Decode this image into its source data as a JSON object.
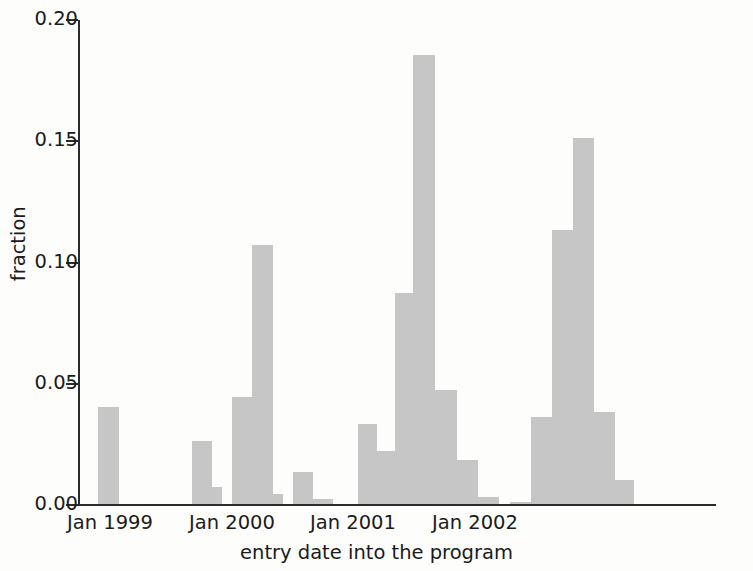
{
  "chart_data": {
    "type": "bar",
    "title": "",
    "subtitle": "",
    "xlabel": "entry date into the program",
    "ylabel": "fraction",
    "ylim": [
      0.0,
      0.2
    ],
    "y_ticks": [
      0.0,
      0.05,
      0.1,
      0.15,
      0.2
    ],
    "y_tick_labels": [
      "0.00",
      "0.05",
      "0.10",
      "0.15",
      "0.20"
    ],
    "x_tick_labels": [
      "Jan 1999",
      "Jan 2000",
      "Jan 2001",
      "Jan 2002"
    ],
    "x_tick_months": [
      "1999-01",
      "2000-01",
      "2001-01",
      "2002-01"
    ],
    "grid": false,
    "legend": null,
    "bar_color": "#c6c6c6",
    "axis_color": "#2b2b2b",
    "note": "histogram of entry dates, bin width approx 1-2 months",
    "categories": [
      "1999-01",
      "1999-09",
      "1999-11",
      "1999-12",
      "2000-01",
      "2000-03",
      "2000-06",
      "2000-08",
      "2000-12",
      "2001-02",
      "2001-03",
      "2001-04",
      "2001-05",
      "2001-06",
      "2001-08",
      "2001-11",
      "2001-12",
      "2002-01",
      "2002-02",
      "2002-03",
      "2002-05"
    ],
    "values": [
      0.04,
      0.026,
      0.007,
      0.044,
      0.107,
      0.004,
      0.013,
      0.002,
      0.033,
      0.022,
      0.087,
      0.185,
      0.047,
      0.018,
      0.003,
      0.001,
      0.036,
      0.113,
      0.151,
      0.038,
      0.01
    ],
    "bars_px": [
      {
        "x": 98,
        "w": 21,
        "v": 0.04
      },
      {
        "x": 192,
        "w": 20,
        "v": 0.026
      },
      {
        "x": 212,
        "w": 10,
        "v": 0.007
      },
      {
        "x": 232,
        "w": 20,
        "v": 0.044
      },
      {
        "x": 252,
        "w": 21,
        "v": 0.107
      },
      {
        "x": 273,
        "w": 10,
        "v": 0.004
      },
      {
        "x": 293,
        "w": 20,
        "v": 0.013
      },
      {
        "x": 313,
        "w": 20,
        "v": 0.002
      },
      {
        "x": 358,
        "w": 19,
        "v": 0.033
      },
      {
        "x": 377,
        "w": 18,
        "v": 0.022
      },
      {
        "x": 395,
        "w": 18,
        "v": 0.087
      },
      {
        "x": 413,
        "w": 22,
        "v": 0.185
      },
      {
        "x": 435,
        "w": 22,
        "v": 0.047
      },
      {
        "x": 457,
        "w": 21,
        "v": 0.018
      },
      {
        "x": 478,
        "w": 21,
        "v": 0.003
      },
      {
        "x": 510,
        "w": 21,
        "v": 0.001
      },
      {
        "x": 531,
        "w": 21,
        "v": 0.036
      },
      {
        "x": 552,
        "w": 21,
        "v": 0.113
      },
      {
        "x": 573,
        "w": 21,
        "v": 0.151
      },
      {
        "x": 594,
        "w": 21,
        "v": 0.038
      },
      {
        "x": 615,
        "w": 19,
        "v": 0.01
      }
    ]
  },
  "axis_geometry": {
    "plot_left_px": 78,
    "plot_bottom_px": 504,
    "plot_top_px": 20,
    "plot_right_px": 716,
    "px_per_unit": 2425,
    "x_tick_px": [
      110,
      232,
      353,
      475
    ]
  }
}
